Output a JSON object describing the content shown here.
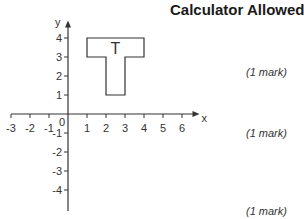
{
  "header": {
    "title": "Calculator Allowed"
  },
  "marks": [
    {
      "label": "(1 mark)"
    },
    {
      "label": "(1 mark)"
    },
    {
      "label": "(1 mark)"
    }
  ],
  "chart_data": {
    "type": "diagram",
    "title": "Calculator Allowed",
    "xlabel": "x",
    "ylabel": "y",
    "x_ticks": [
      -3,
      -2,
      -1,
      0,
      1,
      2,
      3,
      4,
      5,
      6
    ],
    "y_ticks": [
      -4,
      -3,
      -2,
      -1,
      1,
      2,
      3,
      4
    ],
    "xlim": [
      -3,
      6.5
    ],
    "ylim": [
      -5,
      4.5
    ],
    "shape": {
      "label": "T",
      "vertices": [
        [
          1,
          4
        ],
        [
          4,
          4
        ],
        [
          4,
          3
        ],
        [
          3,
          3
        ],
        [
          3,
          1
        ],
        [
          2,
          1
        ],
        [
          2,
          3
        ],
        [
          1,
          3
        ]
      ]
    },
    "origin_label": "0",
    "grid": false
  }
}
